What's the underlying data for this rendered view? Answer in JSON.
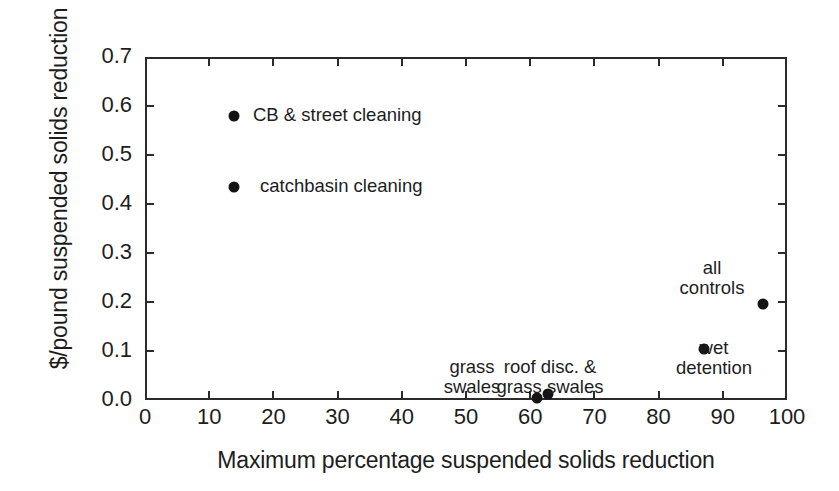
{
  "chart_data": {
    "type": "scatter",
    "title": "",
    "xlabel": "Maximum percentage suspended solids reduction",
    "ylabel": "$/pound suspended solids reduction",
    "xlim": [
      0,
      100
    ],
    "ylim": [
      0.0,
      0.7
    ],
    "grid": false,
    "legend": "none",
    "xticks": [
      "0",
      "10",
      "20",
      "30",
      "40",
      "50",
      "60",
      "70",
      "80",
      "90",
      "100"
    ],
    "xtick_values": [
      0,
      10,
      20,
      30,
      40,
      50,
      60,
      70,
      80,
      90,
      100
    ],
    "yticks": [
      "0.0",
      "0.1",
      "0.2",
      "0.3",
      "0.4",
      "0.5",
      "0.6",
      "0.7"
    ],
    "ytick_values": [
      0.0,
      0.1,
      0.2,
      0.3,
      0.4,
      0.5,
      0.6,
      0.7
    ],
    "points": [
      {
        "label": "CB & street cleaning",
        "x": 13.8,
        "y": 0.58
      },
      {
        "label": "catchbasin cleaning",
        "x": 13.8,
        "y": 0.435
      },
      {
        "label": "grass swales",
        "x": 61.0,
        "y": 0.005
      },
      {
        "label": "roof disc. & grass swales",
        "x": 62.8,
        "y": 0.012
      },
      {
        "label": "wet detention",
        "x": 87.0,
        "y": 0.105
      },
      {
        "label": "all controls",
        "x": 96.3,
        "y": 0.196
      }
    ],
    "annotations": [
      {
        "name": "cb-street-cleaning",
        "text": "CB & street cleaning",
        "align": "left",
        "x": 253,
        "y": 105
      },
      {
        "name": "catchbasin-cleaning",
        "text": "catchbasin cleaning",
        "align": "left",
        "x": 260,
        "y": 176
      },
      {
        "name": "grass-swales",
        "text": "grass\nswales",
        "align": "center",
        "x": 472,
        "y": 357
      },
      {
        "name": "roof-disc-grass-swales",
        "text": "roof disc. &\ngrass swales",
        "align": "center",
        "x": 550,
        "y": 357
      },
      {
        "name": "wet-detention",
        "text": "wet\ndetention",
        "align": "center",
        "x": 714,
        "y": 338
      },
      {
        "name": "all-controls",
        "text": "all\ncontrols",
        "align": "center",
        "x": 712,
        "y": 258
      }
    ],
    "colors": {
      "marker": "#141414",
      "axis": "#2b2b2b",
      "text": "#1d1d1d",
      "background": "#ffffff"
    }
  }
}
